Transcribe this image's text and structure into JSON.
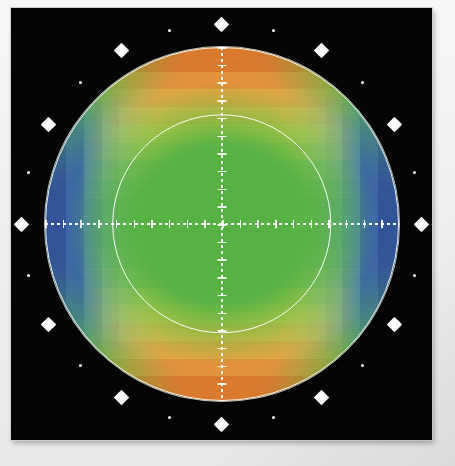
{
  "figure": {
    "title": "",
    "background_color": "#f2f1ef",
    "panel_color": "#050505",
    "overlay_color": "#ffffff"
  },
  "panel": {
    "left": 11,
    "top": 8,
    "width": 421,
    "height": 432
  },
  "chart_data": {
    "type": "heatmap",
    "subtype": "filled-polar-contour",
    "title": "",
    "subtitle": "",
    "xlabel": "",
    "ylabel": "",
    "legend": [],
    "annotations": [],
    "grid": true,
    "projection": "polar-disc",
    "disc": {
      "center_x": 0,
      "center_y": 0,
      "outer_radius": 1.0,
      "inner_circle_radius": 0.62
    },
    "axes": {
      "horizontal_axis": true,
      "vertical_axis": true,
      "axis_style": "dotted",
      "tick_count_per_axis": 20,
      "xlim": [
        -1,
        1
      ],
      "ylim": [
        -1,
        1
      ]
    },
    "angular_markers": {
      "count": 24,
      "step_degrees": 15,
      "major_every": 2,
      "major_shape": "diamond",
      "minor_shape": "dot",
      "radius_factor": 1.13
    },
    "colormap": {
      "name": "rainbow-contour",
      "levels": 14,
      "stops": [
        "#2f4e9e",
        "#3a62ab",
        "#4a7cb8",
        "#5d96c4",
        "#72afcd",
        "#85c2cb",
        "#93c8a8",
        "#6bb946",
        "#87c047",
        "#a9c947",
        "#cdd049",
        "#e2cf46",
        "#e8bc43",
        "#eaa63f",
        "#e8903a",
        "#e2762c"
      ]
    },
    "field": {
      "description": "saddle / quadrupole pattern",
      "maxima_at_degrees": [
        90,
        270
      ],
      "maxima_color": "#e2762c",
      "minima_at_degrees": [
        0,
        180
      ],
      "minima_color": "#2f4e9e",
      "center_value_color": "#5cb446"
    },
    "categories": [
      "0",
      "45",
      "90",
      "135",
      "180",
      "225",
      "270",
      "315"
    ],
    "values": [
      0.05,
      0.42,
      1.0,
      0.42,
      0.05,
      0.42,
      1.0,
      0.42
    ]
  }
}
